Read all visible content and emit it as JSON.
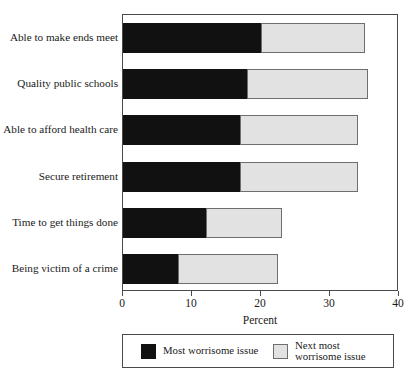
{
  "chart_data": {
    "type": "bar",
    "orientation": "horizontal",
    "stacked": true,
    "title": "",
    "xlabel": "Percent",
    "ylabel": "",
    "xlim": [
      0,
      40
    ],
    "xticks": [
      0,
      10,
      20,
      30,
      40
    ],
    "xtick_labels": [
      "0",
      "10",
      "20",
      "30",
      "40"
    ],
    "grid": false,
    "legend_position": "bottom",
    "categories": [
      "Able to make ends meet",
      "Quality public schools",
      "Able to afford health care",
      "Secure retirement",
      "Time to get things done",
      "Being victim of a crime"
    ],
    "series": [
      {
        "name": "Most worrisome issue",
        "color": "#111111",
        "values": [
          20,
          18,
          17,
          17,
          12,
          8
        ]
      },
      {
        "name": "Next most\nworrisome issue",
        "color": "#e2e2e2",
        "values": [
          15,
          17.5,
          17,
          17,
          11,
          14.5
        ]
      }
    ],
    "totals": [
      35,
      35.5,
      34,
      34,
      23,
      22.5
    ]
  },
  "axis": {
    "x_label": "Percent",
    "tick_0": "0",
    "tick_1": "10",
    "tick_2": "20",
    "tick_3": "30",
    "tick_4": "40"
  },
  "legend": {
    "entries": [
      {
        "label": "Most worrisome issue",
        "color": "#111111"
      },
      {
        "label": "Next most\nworrisome issue",
        "color": "#e2e2e2"
      }
    ]
  },
  "categories": {
    "c0": "Able to make ends meet",
    "c1": "Quality public schools",
    "c2": "Able to afford health care",
    "c3": "Secure retirement",
    "c4": "Time to get things done",
    "c5": "Being victim of a crime"
  }
}
